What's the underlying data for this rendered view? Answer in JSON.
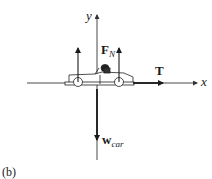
{
  "figure": {
    "panel_label": "(b)",
    "axes": {
      "x_label": "x",
      "y_label": "y"
    },
    "forces": {
      "normal": {
        "symbol": "F",
        "subscript": "N",
        "direction": "up",
        "count": 2
      },
      "tension": {
        "symbol": "T",
        "direction": "right"
      },
      "weight": {
        "symbol": "w",
        "subscript": "car",
        "direction": "down"
      }
    },
    "object": "car-with-driver",
    "colors": {
      "ink": "#1a1a1a",
      "axis": "#333333",
      "background": "#ffffff"
    }
  }
}
